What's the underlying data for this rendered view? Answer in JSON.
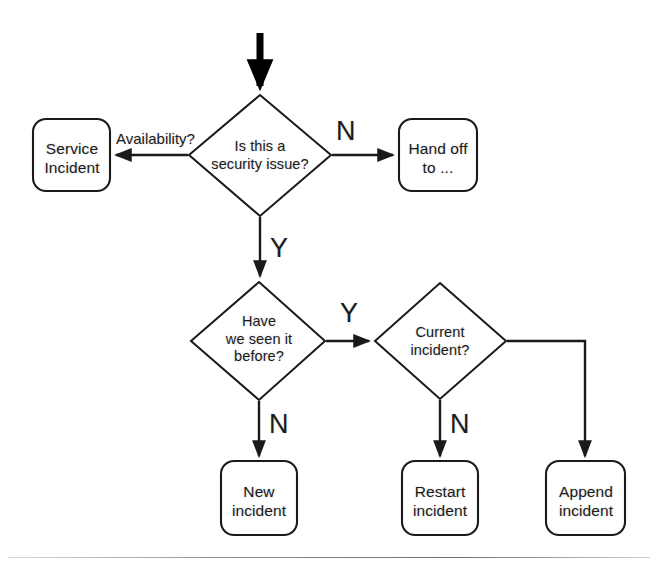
{
  "diagram": {
    "background_color": "#ffffff",
    "line_color": "#1a1a1a",
    "text_color": "#1b1b1b",
    "nodes": [
      {
        "id": "service_incident",
        "shape": "rounded-box",
        "text": "Service\nIncident",
        "line1": "Service",
        "line2": "Incident"
      },
      {
        "id": "security_question",
        "shape": "diamond",
        "text": "Is this a\nsecurity issue?",
        "line1": "Is this a",
        "line2": "security issue?"
      },
      {
        "id": "hand_off",
        "shape": "rounded-box",
        "text": "Hand off\nto ...",
        "line1": "Hand off",
        "line2": "to ..."
      },
      {
        "id": "seen_before_question",
        "shape": "diamond",
        "text": "Have\nwe seen it\nbefore?",
        "line1": "Have",
        "line2": "we seen it",
        "line3": "before?"
      },
      {
        "id": "current_incident_question",
        "shape": "diamond",
        "text": "Current\nincident?",
        "line1": "Current",
        "line2": "incident?"
      },
      {
        "id": "new_incident",
        "shape": "rounded-box",
        "text": "New\nincident",
        "line1": "New",
        "line2": "incident"
      },
      {
        "id": "restart_incident",
        "shape": "rounded-box",
        "text": "Restart\nincident",
        "line1": "Restart",
        "line2": "incident"
      },
      {
        "id": "append_incident",
        "shape": "rounded-box",
        "text": "Append\nincident",
        "line1": "Append",
        "line2": "incident"
      }
    ],
    "edges": [
      {
        "id": "entry",
        "from": "start",
        "to": "security_question",
        "label": ""
      },
      {
        "id": "security_to_service",
        "from": "security_question",
        "to": "service_incident",
        "label": "Availability?"
      },
      {
        "id": "security_to_handoff",
        "from": "security_question",
        "to": "hand_off",
        "label": "N"
      },
      {
        "id": "security_to_seen",
        "from": "security_question",
        "to": "seen_before_question",
        "label": "Y"
      },
      {
        "id": "seen_to_current",
        "from": "seen_before_question",
        "to": "current_incident_question",
        "label": "Y"
      },
      {
        "id": "seen_to_new",
        "from": "seen_before_question",
        "to": "new_incident",
        "label": "N"
      },
      {
        "id": "current_to_restart",
        "from": "current_incident_question",
        "to": "restart_incident",
        "label": "N"
      },
      {
        "id": "current_to_append",
        "from": "current_incident_question",
        "to": "append_incident",
        "label": ""
      }
    ]
  }
}
